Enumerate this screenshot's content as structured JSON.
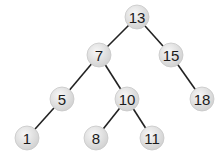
{
  "diagram": {
    "type": "binary-search-tree",
    "style": {
      "node_fill_center": "#f4f4f4",
      "node_fill_edge": "#cfcfcf",
      "node_stroke": "#c8c8c8",
      "edge_color": "#222222",
      "text_color": "#1a1a1a",
      "node_radius": 12
    },
    "nodes": [
      {
        "id": "n13",
        "label": "13",
        "x": 137,
        "y": 17
      },
      {
        "id": "n7",
        "label": "7",
        "x": 99,
        "y": 55
      },
      {
        "id": "n15",
        "label": "15",
        "x": 171,
        "y": 55
      },
      {
        "id": "n5",
        "label": "5",
        "x": 62,
        "y": 99
      },
      {
        "id": "n10",
        "label": "10",
        "x": 127,
        "y": 99
      },
      {
        "id": "n18",
        "label": "18",
        "x": 202,
        "y": 99
      },
      {
        "id": "n1",
        "label": "1",
        "x": 27,
        "y": 138
      },
      {
        "id": "n8",
        "label": "8",
        "x": 96,
        "y": 138
      },
      {
        "id": "n11",
        "label": "11",
        "x": 152,
        "y": 138
      }
    ],
    "edges": [
      {
        "from": "n13",
        "to": "n7"
      },
      {
        "from": "n13",
        "to": "n15"
      },
      {
        "from": "n7",
        "to": "n5"
      },
      {
        "from": "n7",
        "to": "n10"
      },
      {
        "from": "n15",
        "to": "n18"
      },
      {
        "from": "n5",
        "to": "n1"
      },
      {
        "from": "n10",
        "to": "n8"
      },
      {
        "from": "n10",
        "to": "n11"
      }
    ]
  }
}
